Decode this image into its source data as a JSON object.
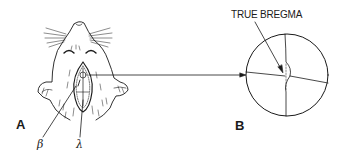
{
  "figure": {
    "panels": [
      {
        "id": "A",
        "label": "A",
        "description": "Dorsal view of rat head with midline scalp incision exposing skull"
      },
      {
        "id": "B",
        "label": "B",
        "description": "Magnified circular view of skull sutures at bregma"
      }
    ],
    "annotations": {
      "true_bregma": "TRUE BREGMA",
      "beta": "β",
      "lambda": "λ"
    },
    "colors": {
      "ink": "#1a1a1a",
      "background": "#ffffff"
    }
  }
}
